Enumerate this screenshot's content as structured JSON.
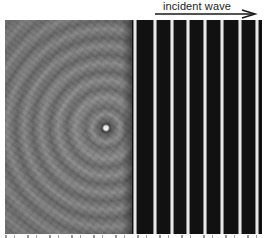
{
  "annotation": {
    "label": "incident wave",
    "arrow_direction": "right"
  },
  "figure": {
    "point_source_position": [
      106,
      128
    ],
    "stripe_x_positions": [
      135,
      155,
      172,
      188,
      205,
      222,
      240,
      257
    ],
    "colors": {
      "background": "#ffffff",
      "gray_field": "#7a7a7a",
      "stripe_dark": "#111111",
      "stripe_light": "#f2f2f2",
      "label_text": "#222222"
    }
  }
}
